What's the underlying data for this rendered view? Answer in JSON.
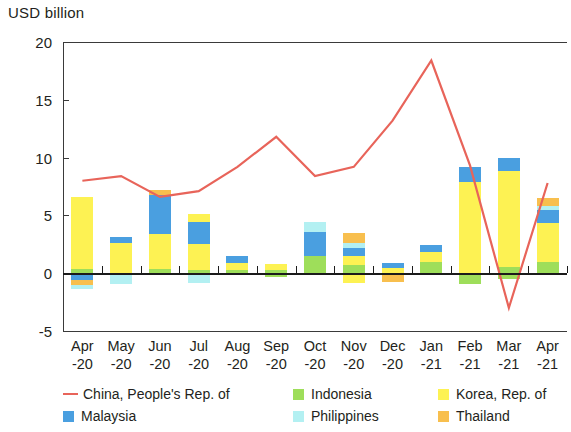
{
  "axis_title": "USD billion",
  "legend": {
    "items": [
      {
        "label": "China, People's Rep. of",
        "color": "#e8645a",
        "marker": "line"
      },
      {
        "label": "Indonesia",
        "color": "#9ede5a",
        "marker": "swatch"
      },
      {
        "label": "Korea, Rep. of",
        "color": "#fdf253",
        "marker": "swatch"
      },
      {
        "label": "Malaysia",
        "color": "#4a9fe0",
        "marker": "swatch"
      },
      {
        "label": "Philippines",
        "color": "#b3f0f2",
        "marker": "swatch"
      },
      {
        "label": "Thailand",
        "color": "#f8bf4e",
        "marker": "swatch"
      }
    ]
  },
  "chart_data": {
    "type": "bar",
    "subtype": "stacked-bar-with-line",
    "title": "",
    "xlabel": "",
    "ylabel": "USD billion",
    "ylim": [
      -5,
      20
    ],
    "yticks": [
      -5,
      0,
      5,
      10,
      15,
      20
    ],
    "grid": false,
    "legend_position": "bottom",
    "categories": [
      "Apr\n-20",
      "May\n-20",
      "Jun\n-20",
      "Jul\n-20",
      "Aug\n-20",
      "Sep\n-20",
      "Oct\n-20",
      "Nov\n-20",
      "Dec\n-20",
      "Jan\n-21",
      "Feb\n-21",
      "Mar\n-21",
      "Apr\n-21"
    ],
    "category_labels": [
      {
        "month": "Apr",
        "year": "-20"
      },
      {
        "month": "May",
        "year": "-20"
      },
      {
        "month": "Jun",
        "year": "-20"
      },
      {
        "month": "Jul",
        "year": "-20"
      },
      {
        "month": "Aug",
        "year": "-20"
      },
      {
        "month": "Sep",
        "year": "-20"
      },
      {
        "month": "Oct",
        "year": "-20"
      },
      {
        "month": "Nov",
        "year": "-20"
      },
      {
        "month": "Dec",
        "year": "-20"
      },
      {
        "month": "Jan",
        "year": "-21"
      },
      {
        "month": "Feb",
        "year": "-21"
      },
      {
        "month": "Mar",
        "year": "-21"
      },
      {
        "month": "Apr",
        "year": "-21"
      }
    ],
    "series": [
      {
        "name": "Indonesia",
        "type": "bar",
        "color": "#9ede5a",
        "values": [
          0.35,
          0,
          0.35,
          0.3,
          0.3,
          0.3,
          1.5,
          0.7,
          0,
          1.0,
          0,
          0.5,
          1.0
        ]
      },
      {
        "name": "Korea, Rep. of",
        "type": "bar",
        "color": "#fdf253",
        "values": [
          6.2,
          2.6,
          3.0,
          2.2,
          0.6,
          0.5,
          0,
          0.8,
          0.45,
          0.8,
          7.9,
          8.3,
          3.3
        ]
      },
      {
        "name": "Malaysia",
        "type": "bar",
        "color": "#4a9fe0",
        "values": [
          0,
          0.55,
          3.4,
          1.9,
          0.6,
          0,
          2.1,
          0.7,
          0.45,
          0.6,
          1.3,
          1.2,
          1.2
        ]
      },
      {
        "name": "Philippines",
        "type": "bar",
        "color": "#b3f0f2",
        "values": [
          0,
          0,
          0,
          0,
          0,
          0,
          0.8,
          0.4,
          0,
          0,
          0,
          0,
          0.3
        ]
      },
      {
        "name": "Thailand",
        "type": "bar",
        "color": "#f8bf4e",
        "values": [
          0,
          0,
          0.45,
          0,
          0,
          0,
          0,
          0.9,
          0,
          0,
          0,
          0,
          0.7
        ]
      },
      {
        "name": "Korea, Rep. of (top)",
        "type": "bar",
        "color": "#fdf253",
        "values": [
          0,
          0,
          0,
          0.7,
          0,
          0,
          0,
          0,
          0,
          0,
          0,
          0,
          0
        ]
      },
      {
        "name": "negatives",
        "type": "bar-negative",
        "stacks": [
          [
            {
              "name": "Malaysia",
              "color": "#4a9fe0",
              "value": -0.55
            },
            {
              "name": "Thailand",
              "color": "#f8bf4e",
              "value": -0.45
            },
            {
              "name": "Philippines",
              "color": "#b3f0f2",
              "value": -0.35
            }
          ],
          [
            {
              "name": "Philippines",
              "color": "#b3f0f2",
              "value": -0.95
            }
          ],
          [],
          [
            {
              "name": "Philippines",
              "color": "#b3f0f2",
              "value": -0.85
            }
          ],
          [],
          [
            {
              "name": "Indonesia",
              "color": "#9ede5a",
              "value": -0.35
            }
          ],
          [],
          [
            {
              "name": "Korea, Rep. of",
              "color": "#fdf253",
              "value": -0.85
            }
          ],
          [
            {
              "name": "Thailand",
              "color": "#f8bf4e",
              "value": -0.75
            }
          ],
          [],
          [
            {
              "name": "Indonesia",
              "color": "#9ede5a",
              "value": -0.95
            }
          ],
          [
            {
              "name": "Indonesia",
              "color": "#9ede5a",
              "value": -0.5
            }
          ],
          []
        ]
      },
      {
        "name": "China, People's Rep. of",
        "type": "line",
        "color": "#e8645a",
        "values": [
          8.0,
          8.4,
          6.6,
          7.1,
          9.2,
          11.8,
          8.4,
          9.2,
          13.2,
          18.4,
          9.3,
          -3.0,
          7.8
        ]
      }
    ]
  }
}
